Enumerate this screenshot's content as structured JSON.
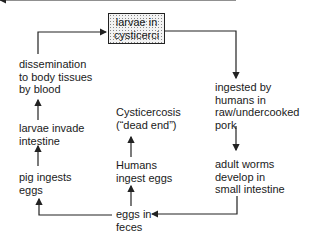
{
  "diagram": {
    "nodes": {
      "larvae_cysticerci": {
        "line1": "larvae in",
        "line2": "cysticerci"
      },
      "dissemination": {
        "line1": "dissemination",
        "line2": "to body tissues",
        "line3": "by blood"
      },
      "ingested": {
        "line1": "ingested by",
        "line2": "humans in",
        "line3": "raw/undercooked",
        "line4": "pork"
      },
      "larvae_invade": {
        "line1": "larvae invade",
        "line2": "intestine"
      },
      "cysticercosis": {
        "line1": "Cysticercosis",
        "line2": "(“dead end”)"
      },
      "pig_ingests": {
        "line1": "pig ingests",
        "line2": "eggs"
      },
      "humans_ingest": {
        "line1": "Humans",
        "line2": "ingest eggs"
      },
      "adult_worms": {
        "line1": "adult worms",
        "line2": "develop in",
        "line3": "small intestine"
      },
      "eggs_feces": {
        "line1": "eggs in",
        "line2": "feces"
      }
    },
    "edges": [
      {
        "from": "dissemination",
        "to": "larvae_cysticerci"
      },
      {
        "from": "larvae_cysticerci",
        "to": "ingested"
      },
      {
        "from": "ingested",
        "to": "adult_worms"
      },
      {
        "from": "adult_worms",
        "to": "eggs_feces"
      },
      {
        "from": "eggs_feces",
        "to": "pig_ingests"
      },
      {
        "from": "eggs_feces",
        "to": "humans_ingest"
      },
      {
        "from": "humans_ingest",
        "to": "cysticercosis"
      },
      {
        "from": "pig_ingests",
        "to": "larvae_invade"
      },
      {
        "from": "larvae_invade",
        "to": "dissemination"
      }
    ],
    "colors": {
      "line": "#222222",
      "box_fill": "#f3f3f3"
    }
  }
}
